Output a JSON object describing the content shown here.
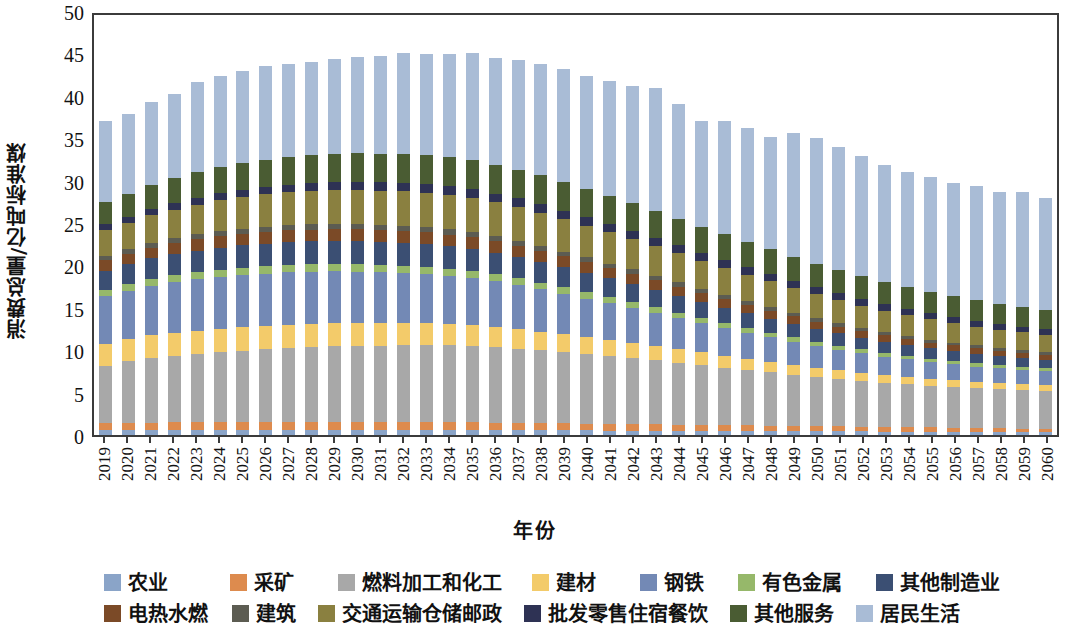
{
  "chart_data": {
    "type": "bar",
    "stacked": true,
    "title": "",
    "xlabel": "年份",
    "ylabel": "消费总量/亿吨标准煤",
    "ylim": [
      0,
      50
    ],
    "yticks": [
      0,
      5,
      10,
      15,
      20,
      25,
      30,
      35,
      40,
      45,
      50
    ],
    "grid": false,
    "legend_position": "bottom",
    "categories": [
      "2019",
      "2020",
      "2021",
      "2022",
      "2023",
      "2024",
      "2025",
      "2026",
      "2027",
      "2028",
      "2029",
      "2030",
      "2031",
      "2032",
      "2033",
      "2034",
      "2035",
      "2036",
      "2037",
      "2038",
      "2039",
      "2040",
      "2041",
      "2042",
      "2043",
      "2044",
      "2045",
      "2046",
      "2047",
      "2048",
      "2049",
      "2050",
      "2051",
      "2052",
      "2053",
      "2054",
      "2055",
      "2056",
      "2057",
      "2058",
      "2059",
      "2060"
    ],
    "series": [
      {
        "name": "农业",
        "color": "#8aa4c8",
        "values": [
          0.55,
          0.56,
          0.57,
          0.58,
          0.58,
          0.59,
          0.6,
          0.6,
          0.6,
          0.6,
          0.6,
          0.6,
          0.6,
          0.6,
          0.6,
          0.6,
          0.59,
          0.58,
          0.57,
          0.56,
          0.55,
          0.54,
          0.53,
          0.52,
          0.51,
          0.5,
          0.49,
          0.48,
          0.47,
          0.46,
          0.45,
          0.44,
          0.43,
          0.42,
          0.41,
          0.4,
          0.39,
          0.38,
          0.37,
          0.36,
          0.35,
          0.34
        ]
      },
      {
        "name": "采矿",
        "color": "#dd8b4e",
        "values": [
          0.85,
          0.87,
          0.9,
          0.92,
          0.94,
          0.95,
          0.96,
          0.97,
          0.97,
          0.97,
          0.97,
          0.96,
          0.95,
          0.94,
          0.93,
          0.92,
          0.9,
          0.88,
          0.86,
          0.84,
          0.82,
          0.8,
          0.78,
          0.76,
          0.74,
          0.72,
          0.7,
          0.68,
          0.66,
          0.64,
          0.62,
          0.6,
          0.58,
          0.56,
          0.54,
          0.52,
          0.5,
          0.48,
          0.46,
          0.44,
          0.42,
          0.4
        ]
      },
      {
        "name": "燃料加工和化工",
        "color": "#a8a8a8",
        "values": [
          6.75,
          7.25,
          7.6,
          7.85,
          8.05,
          8.25,
          8.4,
          8.55,
          8.7,
          8.8,
          8.9,
          8.95,
          9.0,
          9.05,
          9.05,
          9.05,
          9.0,
          8.9,
          8.75,
          8.6,
          8.4,
          8.2,
          8.0,
          7.8,
          7.55,
          7.3,
          7.05,
          6.8,
          6.55,
          6.3,
          6.05,
          5.8,
          5.6,
          5.4,
          5.2,
          5.05,
          4.9,
          4.8,
          4.7,
          4.6,
          4.55,
          4.5
        ]
      },
      {
        "name": "建材",
        "color": "#f3cb6a",
        "values": [
          2.6,
          2.65,
          2.7,
          2.72,
          2.74,
          2.75,
          2.76,
          2.76,
          2.76,
          2.74,
          2.72,
          2.7,
          2.66,
          2.62,
          2.58,
          2.52,
          2.46,
          2.38,
          2.3,
          2.2,
          2.1,
          2.0,
          1.9,
          1.8,
          1.7,
          1.6,
          1.5,
          1.4,
          1.32,
          1.24,
          1.16,
          1.1,
          1.04,
          0.98,
          0.94,
          0.9,
          0.86,
          0.82,
          0.78,
          0.75,
          0.72,
          0.7
        ]
      },
      {
        "name": "钢铁",
        "color": "#7389b5"
      },
      {
        "name": "有色金属",
        "color": "#96b86a"
      },
      {
        "name": "其他制造业",
        "color": "#3b4f73"
      },
      {
        "name": "电热水燃",
        "color": "#7b4a27"
      },
      {
        "name": "建筑",
        "color": "#5c5c52"
      },
      {
        "name": "交通运输仓储邮政",
        "color": "#8a8040"
      },
      {
        "name": "批发零售住宿餐饮",
        "color": "#2e3254"
      },
      {
        "name": "其他服务",
        "color": "#4a5c33"
      },
      {
        "name": "居民生活",
        "color": "#a9bcd6"
      }
    ],
    "totals": [
      35.0,
      35.9,
      37.3,
      38.3,
      39.6,
      40.4,
      40.9,
      41.5,
      41.8,
      42.0,
      42.3,
      42.6,
      42.7,
      43.0,
      43.0,
      43.0,
      43.0,
      42.5,
      42.2,
      41.8,
      41.2,
      40.3,
      39.7,
      39.2,
      38.9,
      38.0,
      37.0,
      37.0,
      36.2,
      35.2,
      35.6,
      35.0,
      34.5,
      33.9,
      32.9,
      32.0,
      31.4,
      30.7,
      30.4,
      29.7,
      29.7,
      29.0
    ],
    "stack_matrix": [
      [
        0.55,
        0.85,
        6.75,
        2.6,
        5.6,
        0.75,
        2.3,
        1.2,
        0.55,
        3.0,
        0.7,
        2.6,
        9.55
      ],
      [
        0.56,
        0.87,
        7.25,
        2.65,
        5.7,
        0.78,
        2.35,
        1.23,
        0.56,
        3.1,
        0.72,
        2.68,
        9.45
      ],
      [
        0.57,
        0.9,
        7.6,
        2.7,
        5.85,
        0.8,
        2.42,
        1.26,
        0.58,
        3.25,
        0.75,
        2.8,
        9.82
      ],
      [
        0.58,
        0.92,
        7.85,
        2.72,
        5.95,
        0.82,
        2.48,
        1.29,
        0.59,
        3.38,
        0.78,
        2.9,
        9.94
      ],
      [
        0.58,
        0.94,
        8.05,
        2.74,
        6.05,
        0.84,
        2.55,
        1.32,
        0.6,
        3.52,
        0.81,
        3.0,
        10.6
      ],
      [
        0.59,
        0.95,
        8.25,
        2.75,
        6.1,
        0.85,
        2.6,
        1.34,
        0.61,
        3.64,
        0.84,
        3.08,
        10.8
      ],
      [
        0.6,
        0.96,
        8.4,
        2.76,
        6.14,
        0.86,
        2.64,
        1.36,
        0.62,
        3.72,
        0.86,
        3.14,
        10.84
      ],
      [
        0.6,
        0.97,
        8.55,
        2.76,
        6.16,
        0.87,
        2.67,
        1.38,
        0.63,
        3.8,
        0.88,
        3.2,
        11.03
      ],
      [
        0.6,
        0.97,
        8.7,
        2.76,
        6.16,
        0.87,
        2.69,
        1.39,
        0.63,
        3.86,
        0.9,
        3.24,
        11.0
      ],
      [
        0.6,
        0.97,
        8.8,
        2.74,
        6.14,
        0.88,
        2.7,
        1.4,
        0.64,
        3.92,
        0.92,
        3.28,
        11.01
      ],
      [
        0.6,
        0.97,
        8.9,
        2.72,
        6.1,
        0.88,
        2.7,
        1.4,
        0.64,
        3.96,
        0.94,
        3.32,
        11.17
      ],
      [
        0.6,
        0.96,
        8.95,
        2.7,
        6.05,
        0.88,
        2.7,
        1.41,
        0.64,
        4.0,
        0.96,
        3.36,
        11.39
      ],
      [
        0.6,
        0.95,
        9.0,
        2.66,
        5.98,
        0.88,
        2.69,
        1.41,
        0.64,
        4.02,
        0.98,
        3.38,
        11.51
      ],
      [
        0.6,
        0.94,
        9.05,
        2.62,
        5.9,
        0.87,
        2.68,
        1.41,
        0.64,
        4.04,
        1.0,
        3.4,
        11.85
      ],
      [
        0.6,
        0.93,
        9.05,
        2.58,
        5.8,
        0.87,
        2.66,
        1.4,
        0.63,
        4.04,
        1.01,
        3.41,
        11.92
      ],
      [
        0.6,
        0.92,
        9.05,
        2.52,
        5.68,
        0.86,
        2.63,
        1.39,
        0.63,
        4.03,
        1.02,
        3.42,
        12.25
      ],
      [
        0.59,
        0.9,
        9.0,
        2.46,
        5.54,
        0.85,
        2.6,
        1.38,
        0.62,
        4.01,
        1.03,
        3.42,
        12.6
      ],
      [
        0.58,
        0.88,
        8.9,
        2.38,
        5.38,
        0.83,
        2.55,
        1.36,
        0.61,
        3.98,
        1.03,
        3.41,
        12.6
      ],
      [
        0.57,
        0.86,
        8.75,
        2.3,
        5.2,
        0.81,
        2.5,
        1.34,
        0.6,
        3.94,
        1.03,
        3.4,
        12.9
      ],
      [
        0.56,
        0.84,
        8.6,
        2.2,
        5.0,
        0.79,
        2.44,
        1.31,
        0.59,
        3.89,
        1.02,
        3.38,
        13.18
      ],
      [
        0.55,
        0.82,
        8.4,
        2.1,
        4.78,
        0.77,
        2.37,
        1.28,
        0.57,
        3.83,
        1.01,
        3.35,
        13.37
      ],
      [
        0.54,
        0.8,
        8.2,
        2.0,
        4.55,
        0.75,
        2.3,
        1.25,
        0.56,
        3.76,
        1.0,
        3.32,
        13.27
      ],
      [
        0.53,
        0.78,
        8.0,
        1.9,
        4.32,
        0.72,
        2.23,
        1.21,
        0.54,
        3.68,
        0.99,
        3.28,
        13.52
      ],
      [
        0.52,
        0.76,
        7.8,
        1.8,
        4.1,
        0.7,
        2.15,
        1.17,
        0.53,
        3.6,
        0.97,
        3.24,
        13.86
      ],
      [
        0.51,
        0.74,
        7.55,
        1.7,
        3.88,
        0.67,
        2.07,
        1.13,
        0.51,
        3.51,
        0.96,
        3.2,
        14.47
      ],
      [
        0.5,
        0.72,
        7.3,
        1.6,
        3.66,
        0.65,
        1.99,
        1.09,
        0.5,
        3.42,
        0.94,
        3.15,
        13.48
      ],
      [
        0.49,
        0.7,
        7.05,
        1.5,
        3.44,
        0.62,
        1.91,
        1.05,
        0.48,
        3.32,
        0.92,
        3.1,
        12.42
      ],
      [
        0.48,
        0.68,
        6.8,
        1.4,
        3.24,
        0.6,
        1.83,
        1.01,
        0.47,
        3.22,
        0.9,
        3.04,
        13.33
      ],
      [
        0.47,
        0.66,
        6.55,
        1.32,
        3.05,
        0.57,
        1.75,
        0.97,
        0.45,
        3.12,
        0.88,
        2.98,
        13.43
      ],
      [
        0.46,
        0.64,
        6.3,
        1.24,
        2.87,
        0.55,
        1.67,
        0.93,
        0.44,
        3.02,
        0.86,
        2.92,
        13.3
      ],
      [
        0.45,
        0.62,
        6.05,
        1.16,
        2.7,
        0.53,
        1.59,
        0.89,
        0.42,
        2.92,
        0.84,
        2.86,
        14.57
      ],
      [
        0.44,
        0.6,
        5.8,
        1.1,
        2.54,
        0.51,
        1.52,
        0.85,
        0.41,
        2.82,
        0.82,
        2.8,
        14.79
      ],
      [
        0.43,
        0.58,
        5.6,
        1.04,
        2.4,
        0.49,
        1.45,
        0.81,
        0.4,
        2.72,
        0.8,
        2.74,
        14.54
      ],
      [
        0.42,
        0.56,
        5.4,
        0.98,
        2.27,
        0.47,
        1.38,
        0.78,
        0.38,
        2.63,
        0.78,
        2.68,
        14.17
      ],
      [
        0.41,
        0.54,
        5.2,
        0.94,
        2.15,
        0.45,
        1.32,
        0.75,
        0.37,
        2.54,
        0.76,
        2.62,
        13.75
      ],
      [
        0.4,
        0.52,
        5.05,
        0.9,
        2.04,
        0.44,
        1.26,
        0.72,
        0.36,
        2.46,
        0.74,
        2.56,
        13.55
      ],
      [
        0.39,
        0.5,
        4.9,
        0.86,
        1.94,
        0.42,
        1.21,
        0.69,
        0.35,
        2.38,
        0.72,
        2.5,
        13.54
      ],
      [
        0.38,
        0.48,
        4.8,
        0.82,
        1.85,
        0.41,
        1.16,
        0.66,
        0.34,
        2.3,
        0.7,
        2.45,
        13.35
      ],
      [
        0.37,
        0.46,
        4.7,
        0.78,
        1.77,
        0.4,
        1.12,
        0.64,
        0.33,
        2.23,
        0.68,
        2.4,
        13.52
      ],
      [
        0.36,
        0.44,
        4.6,
        0.75,
        1.7,
        0.39,
        1.08,
        0.62,
        0.32,
        2.17,
        0.66,
        2.35,
        13.26
      ],
      [
        0.35,
        0.42,
        4.55,
        0.72,
        1.64,
        0.38,
        1.05,
        0.6,
        0.31,
        2.12,
        0.65,
        2.31,
        13.6
      ],
      [
        0.34,
        0.4,
        4.5,
        0.7,
        1.58,
        0.37,
        1.02,
        0.58,
        0.3,
        2.07,
        0.64,
        2.27,
        13.23
      ]
    ]
  },
  "axis": {
    "y_title": "消费总量/亿吨标准煤",
    "x_title": "年份",
    "y_tick_labels": [
      "0",
      "5",
      "10",
      "15",
      "20",
      "25",
      "30",
      "35",
      "40",
      "45",
      "50"
    ]
  },
  "legend": {
    "row1": [
      {
        "label": "农业",
        "color": "#8aa4c8"
      },
      {
        "label": "采矿",
        "color": "#dd8b4e"
      },
      {
        "label": "燃料加工和化工",
        "color": "#a8a8a8"
      },
      {
        "label": "建材",
        "color": "#f3cb6a"
      },
      {
        "label": "钢铁",
        "color": "#7389b5"
      },
      {
        "label": "有色金属",
        "color": "#96b86a"
      },
      {
        "label": "其他制造业",
        "color": "#3b4f73"
      }
    ],
    "row2": [
      {
        "label": "电热水燃",
        "color": "#7b4a27"
      },
      {
        "label": "建筑",
        "color": "#5c5c52"
      },
      {
        "label": "交通运输仓储邮政",
        "color": "#8a8040"
      },
      {
        "label": "批发零售住宿餐饮",
        "color": "#2e3254"
      },
      {
        "label": "其他服务",
        "color": "#4a5c33"
      },
      {
        "label": "居民生活",
        "color": "#a9bcd6"
      }
    ]
  }
}
